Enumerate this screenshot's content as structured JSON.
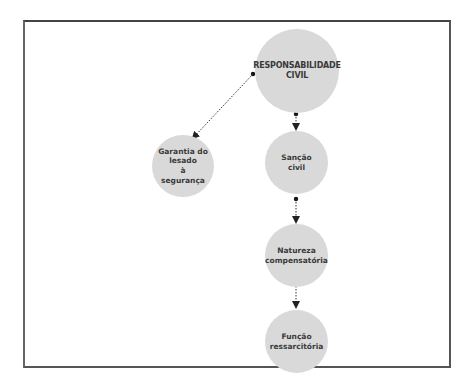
{
  "diagram": {
    "type": "concept-map",
    "colors": {
      "node_fill": "#d9d9d9",
      "text": "#3a3a3a",
      "line": "#333333",
      "frame": "#555555"
    },
    "nodes": [
      {
        "id": "responsabilidade",
        "label": "RESPONSABILIDADE\nCIVIL"
      },
      {
        "id": "garantia",
        "label": "Garantia do\nlesado\nà\nsegurança"
      },
      {
        "id": "sancao",
        "label": "Sanção\ncivil"
      },
      {
        "id": "natureza",
        "label": "Natureza\ncompensatória"
      },
      {
        "id": "funcao",
        "label": "Função\nressarcitória"
      }
    ],
    "edges": [
      {
        "from": "responsabilidade",
        "to": "garantia",
        "style": "dotted-arrow"
      },
      {
        "from": "responsabilidade",
        "to": "sancao",
        "style": "dotted-arrow"
      },
      {
        "from": "sancao",
        "to": "natureza",
        "style": "dotted-arrow"
      },
      {
        "from": "natureza",
        "to": "funcao",
        "style": "dotted-arrow"
      }
    ]
  }
}
